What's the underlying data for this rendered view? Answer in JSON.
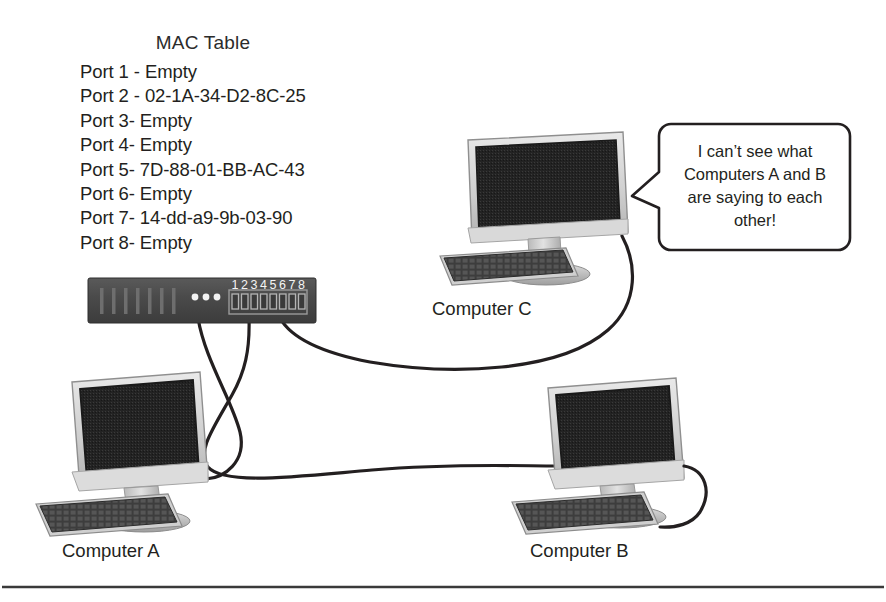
{
  "diagram": {
    "background_color": "#ffffff",
    "line_color": "#231f20"
  },
  "mac_table": {
    "title": "MAC Table",
    "entries": [
      "Port 1 - Empty",
      "Port 2 - 02-1A-34-D2-8C-25",
      "Port 3- Empty",
      "Port 4- Empty",
      "Port 5- 7D-88-01-BB-AC-43",
      "Port 6- Empty",
      "Port 7- 14-dd-a9-9b-03-90",
      "Port 8- Empty"
    ]
  },
  "switch": {
    "name": "8-port network switch",
    "body_color": "#4b4b4b",
    "port_numbers": [
      "1",
      "2",
      "3",
      "4",
      "5",
      "6",
      "7",
      "8"
    ],
    "connected_ports": [
      2,
      5,
      7
    ],
    "led_count": 3,
    "vent_count": 7
  },
  "computers": [
    {
      "id": "a",
      "label": "Computer A",
      "connected_port": 5
    },
    {
      "id": "b",
      "label": "Computer B",
      "connected_port": 2
    },
    {
      "id": "c",
      "label": "Computer C",
      "connected_port": 7
    }
  ],
  "speech_bubble": {
    "speaker": "Computer C",
    "lines": [
      "I can’t see what",
      "Computers A and B",
      "are saying to each",
      "other!"
    ],
    "text": "I can’t see what Computers A and B are saying to each other!"
  },
  "footer_rule": {
    "present": true
  }
}
